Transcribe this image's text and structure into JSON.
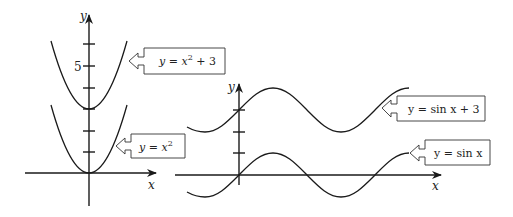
{
  "figure": {
    "left_graph": {
      "x_axis_label": "x",
      "y_axis_label": "y",
      "tick_label": "5",
      "curves": [
        {
          "id": "upper",
          "label": "y = x² + 3",
          "label_parts": [
            "y = x",
            "2",
            " + 3"
          ]
        },
        {
          "id": "lower",
          "label": "y = x²",
          "label_parts": [
            "y = x",
            "2",
            ""
          ]
        }
      ]
    },
    "right_graph": {
      "x_axis_label": "x",
      "y_axis_label": "y",
      "curves": [
        {
          "id": "upper",
          "label": "y = sin x + 3"
        },
        {
          "id": "lower",
          "label": "y = sin x"
        }
      ]
    }
  },
  "colors": {
    "stroke": "#1a1a1a",
    "background": "#ffffff",
    "callout_border": "#333333"
  }
}
